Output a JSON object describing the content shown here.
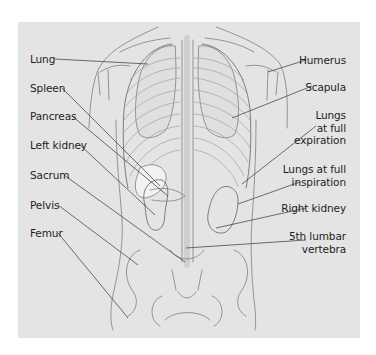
{
  "figure": {
    "type": "anatomical-illustration",
    "view": "posterior torso skeleton with organs",
    "colors": {
      "background": "#ffffff",
      "panel": "#e4e4e4",
      "line": "#8a8a8a",
      "leader": "#4a4a4a",
      "text": "#1e1e1e",
      "lung_fill": "#dcdcdc",
      "spleen_fill": "#f2f2f2"
    }
  },
  "labels_left": [
    {
      "id": "lung",
      "text": "Lung"
    },
    {
      "id": "spleen",
      "text": "Spleen"
    },
    {
      "id": "pancreas",
      "text": "Pancreas"
    },
    {
      "id": "left-kidney",
      "text": "Left kidney"
    },
    {
      "id": "sacrum",
      "text": "Sacrum"
    },
    {
      "id": "pelvis",
      "text": "Pelvis"
    },
    {
      "id": "femur",
      "text": "Femur"
    }
  ],
  "labels_right": [
    {
      "id": "humerus",
      "lines": [
        "Humerus"
      ]
    },
    {
      "id": "scapula",
      "lines": [
        "Scapula"
      ]
    },
    {
      "id": "lungs-expiration",
      "lines": [
        "Lungs",
        "at full",
        "expiration"
      ]
    },
    {
      "id": "lungs-inspiration",
      "lines": [
        "Lungs at full",
        "inspiration"
      ]
    },
    {
      "id": "right-kidney",
      "lines": [
        "Right kidney"
      ]
    },
    {
      "id": "lumbar-vertebra",
      "lines": [
        "5th lumbar",
        "vertebra"
      ]
    }
  ]
}
